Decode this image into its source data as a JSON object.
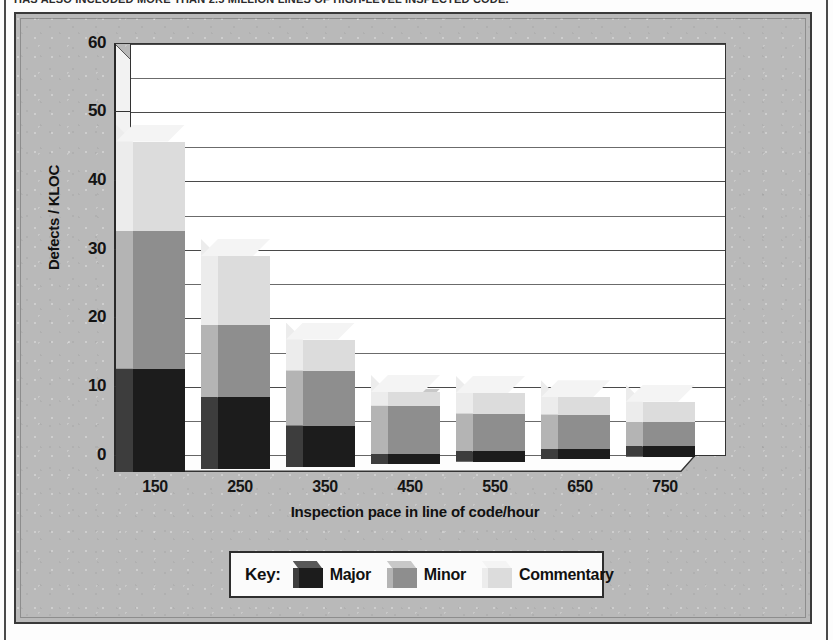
{
  "caption": {
    "text": "HAS ALSO INCLUDED MORE THAN 2.5 MILLION LINES OF HIGH-LEVEL INSPECTED CODE."
  },
  "colors": {
    "major": "#1c1c1c",
    "major_side": "#3d3d3d",
    "major_top": "#585858",
    "minor": "#8e8e8e",
    "minor_side": "#b4b4b4",
    "minor_top": "#c8c8c8",
    "commentary": "#dcdcdc",
    "commentary_side": "#ececec",
    "commentary_top": "#f4f4f4",
    "plot_background": "#ffffff",
    "figure_background": "#b9b9b9",
    "axis": "#2a2a2a"
  },
  "legend": {
    "key_label": "Key:",
    "items": [
      {
        "label": "Major",
        "series": "major"
      },
      {
        "label": "Minor",
        "series": "minor"
      },
      {
        "label": "Commentary",
        "series": "commentary"
      }
    ]
  },
  "chart_data": {
    "type": "bar",
    "stacked": true,
    "projection": "3d-isometric",
    "title": "",
    "xlabel": "Inspection pace in line of code/hour",
    "ylabel": "Defects / KLOC",
    "categories": [
      "150",
      "250",
      "350",
      "450",
      "550",
      "650",
      "750"
    ],
    "ylim": [
      0,
      60
    ],
    "ytick_labels": [
      "0",
      "10",
      "20",
      "30",
      "40",
      "50",
      "60"
    ],
    "ytick_values": [
      0,
      10,
      20,
      30,
      40,
      50,
      60
    ],
    "minor_tick_step": 5,
    "grid": true,
    "legend_position": "bottom",
    "series": [
      {
        "name": "Major",
        "values": [
          15,
          10.5,
          6,
          1.5,
          1.5,
          1.5,
          1.5
        ]
      },
      {
        "name": "Minor",
        "values": [
          20,
          10.5,
          8,
          7,
          5.5,
          5,
          3.5
        ]
      },
      {
        "name": "Commentary",
        "values": [
          13,
          10,
          4.5,
          2,
          3,
          2.5,
          3
        ]
      }
    ],
    "totals": [
      48,
      31,
      18.5,
      10.5,
      10,
      9,
      8
    ]
  }
}
